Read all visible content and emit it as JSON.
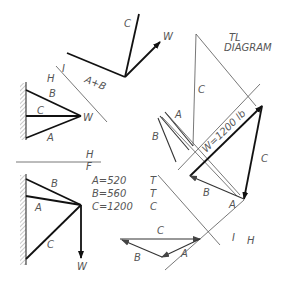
{
  "diagram": {
    "title_line1": "TL",
    "title_line2": "DIAGRAM",
    "labels": {
      "top_C": "C",
      "top_W": "W",
      "top_AB": "A+B",
      "fold_I_top": "I",
      "fold_H_top": "H",
      "top_view_B": "B",
      "top_view_C": "C",
      "top_view_A": "A",
      "top_view_W": "W",
      "fold_H": "H",
      "fold_F": "F",
      "front_B": "B",
      "front_A": "A",
      "front_C": "C",
      "front_W": "W",
      "tl_C": "C",
      "tl_A": "A",
      "tl_B": "B",
      "tl_W": "W=1200  lb",
      "tl_right_C": "C",
      "tl_lower_B": "B",
      "tl_lower_A": "A",
      "fold_H_bottom": "H",
      "fold_I_bottom": "I",
      "poly_C": "C",
      "poly_B": "B",
      "poly_A": "A"
    },
    "results": [
      {
        "member": "A=520",
        "type": "T"
      },
      {
        "member": "B=560",
        "type": "T"
      },
      {
        "member": "C=1200",
        "type": "C"
      }
    ]
  }
}
